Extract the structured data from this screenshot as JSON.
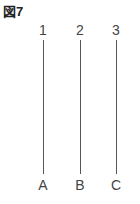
{
  "figure": {
    "title": "図7",
    "top_labels": [
      "1",
      "2",
      "3"
    ],
    "bottom_labels": [
      "A",
      "B",
      "C"
    ],
    "line_color": "#555555"
  }
}
